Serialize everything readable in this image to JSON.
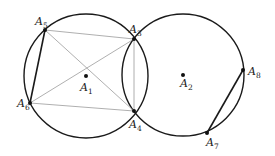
{
  "diagram": {
    "title": "",
    "circles": [
      {
        "name": "circle-a1",
        "cx": 86,
        "cy": 76,
        "r": 62
      },
      {
        "name": "circle-a2",
        "cx": 183,
        "cy": 75,
        "r": 61
      }
    ],
    "points": [
      {
        "id": "A1",
        "base": "A",
        "sub": "1",
        "x": 86,
        "y": 76,
        "lx": 80,
        "ly": 91
      },
      {
        "id": "A2",
        "base": "A",
        "sub": "2",
        "x": 183,
        "y": 75,
        "lx": 180,
        "ly": 87
      },
      {
        "id": "A3",
        "base": "A",
        "sub": "3",
        "x": 134,
        "y": 39,
        "lx": 129,
        "ly": 33
      },
      {
        "id": "A4",
        "base": "A",
        "sub": "4",
        "x": 134,
        "y": 111,
        "lx": 129,
        "ly": 128
      },
      {
        "id": "A5",
        "base": "A",
        "sub": "5",
        "x": 45,
        "y": 30,
        "lx": 35,
        "ly": 25
      },
      {
        "id": "A6",
        "base": "A",
        "sub": "6",
        "x": 30,
        "y": 103,
        "lx": 17,
        "ly": 107
      },
      {
        "id": "A7",
        "base": "A",
        "sub": "7",
        "x": 207,
        "y": 133,
        "lx": 206,
        "ly": 146
      },
      {
        "id": "A8",
        "base": "A",
        "sub": "8",
        "x": 243,
        "y": 70,
        "lx": 248,
        "ly": 75
      }
    ],
    "thick_segments": [
      {
        "from": "A5",
        "to": "A6"
      },
      {
        "from": "A7",
        "to": "A8"
      }
    ],
    "thin_segments": [
      {
        "from": "A5",
        "to": "A3"
      },
      {
        "from": "A6",
        "to": "A4"
      },
      {
        "from": "A5",
        "to": "A4"
      },
      {
        "from": "A6",
        "to": "A3"
      },
      {
        "from": "A3",
        "to": "A4"
      }
    ],
    "colors": {
      "stroke": "#1a1a1a",
      "thin": "#9a9a9a",
      "background": "#ffffff"
    }
  }
}
